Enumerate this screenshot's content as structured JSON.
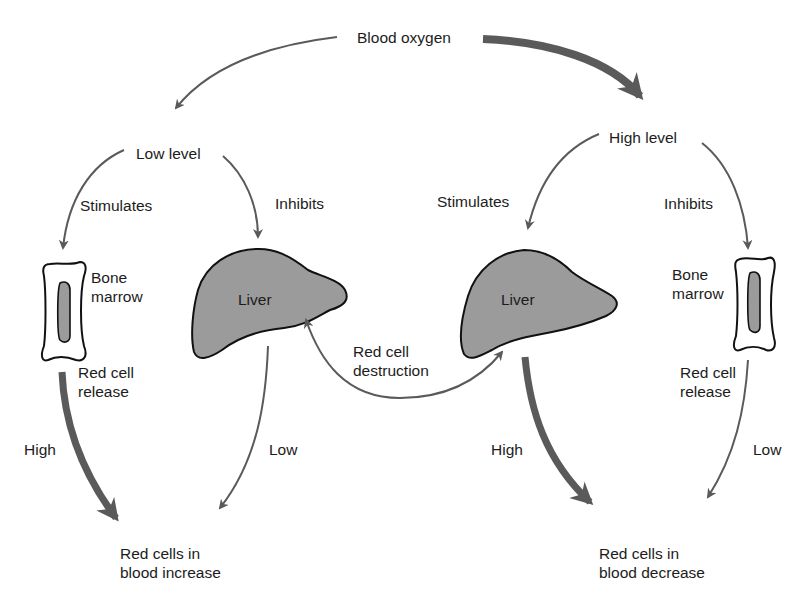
{
  "diagram": {
    "type": "flow",
    "root": {
      "label": "Blood oxygen"
    },
    "low_branch": {
      "level_label": "Low level",
      "stimulates_label": "Stimulates",
      "inhibits_label": "Inhibits",
      "bone_marrow_label": "Bone\nmarrow",
      "liver_label": "Liver",
      "release_label": "Red cell\nrelease",
      "release_rate": "High",
      "liver_rate": "Low",
      "outcome_label": "Red cells in\nblood increase"
    },
    "high_branch": {
      "level_label": "High level",
      "stimulates_label": "Stimulates",
      "inhibits_label": "Inhibits",
      "bone_marrow_label": "Bone\nmarrow",
      "liver_label": "Liver",
      "release_label": "Red cell\nrelease",
      "release_rate": "Low",
      "liver_rate": "High",
      "outcome_label": "Red cells in\nblood decrease"
    },
    "shared": {
      "destruction_label": "Red cell\ndestruction"
    },
    "colors": {
      "arrow": "#5a5a5a",
      "organ_fill": "#9b9b9b",
      "outline": "#111111",
      "background": "#ffffff"
    }
  }
}
